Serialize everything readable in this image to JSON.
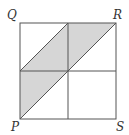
{
  "diagram": {
    "labels": {
      "Q": "Q",
      "R": "R",
      "P": "P",
      "S": "S"
    },
    "colors": {
      "stroke": "#555555",
      "shade": "#d6d6d6",
      "background": "#ffffff"
    },
    "square": {
      "x": 20,
      "y": 23,
      "size": 96
    },
    "shaded_regions": [
      "parallelogram from midpoint of left side to top midpoint to R to center",
      "triangle/parallelogram from P to left midpoint to center"
    ]
  }
}
